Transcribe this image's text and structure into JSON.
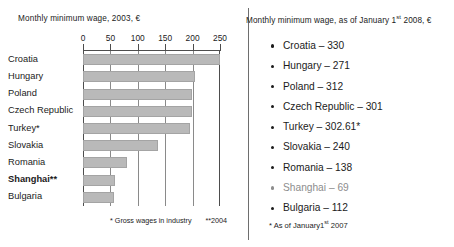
{
  "chart_data": {
    "type": "bar",
    "title": "Monthly minimum wage, 2003, €",
    "xlabel": "",
    "ylabel": "",
    "orientation": "horizontal",
    "xlim": [
      0,
      250
    ],
    "xticks": [
      0,
      50,
      100,
      150,
      200,
      250
    ],
    "xtick_labels": [
      "0",
      "50",
      "100",
      "150",
      "200",
      "250"
    ],
    "grid": true,
    "legend": "none",
    "categories": [
      "Croatia",
      "Hungary",
      "Poland",
      "Czech Republic",
      "Turkey*",
      "Slovakia",
      "Romania",
      "Shanghai**",
      "Bulgaria"
    ],
    "values": [
      250,
      205,
      199,
      199,
      195,
      137,
      80,
      58,
      57
    ],
    "bold_categories": [
      "Shanghai**"
    ],
    "footnote": "* Gross wages in industry   **2004",
    "footnote_parts": [
      "* Gross wages in industry",
      "**2004"
    ],
    "bar_color": "#b9b9b9"
  },
  "left": {
    "title": "Monthly minimum wage, 2003, €",
    "footnote_a": "* Gross wages in industry",
    "footnote_b": "**2004"
  },
  "right": {
    "title_prefix": "Monthly minimum wage, as of January 1",
    "title_sup": "st",
    "title_suffix": " 2008, €",
    "items": [
      {
        "label": "Croatia",
        "value": "330",
        "text": "Croatia – 330",
        "muted": false
      },
      {
        "label": "Hungary",
        "value": "271",
        "text": "Hungary – 271",
        "muted": false
      },
      {
        "label": "Poland",
        "value": "312",
        "text": "Poland – 312",
        "muted": false
      },
      {
        "label": "Czech Republic",
        "value": "301",
        "text": "Czech Republic – 301",
        "muted": false
      },
      {
        "label": "Turkey",
        "value": "302.61*",
        "text": "Turkey – 302.61*",
        "muted": false
      },
      {
        "label": "Slovakia",
        "value": "240",
        "text": "Slovakia – 240",
        "muted": false
      },
      {
        "label": "Romania",
        "value": "138",
        "text": "Romania – 138",
        "muted": false
      },
      {
        "label": "Shanghai",
        "value": "69",
        "text": "Shanghai – 69",
        "muted": true
      },
      {
        "label": "Bulgaria",
        "value": "112",
        "text": "Bulgaria – 112",
        "muted": false
      }
    ],
    "footnote_prefix": "* As of January1",
    "footnote_sup": "st",
    "footnote_suffix": " 2007"
  },
  "colors": {
    "bar_fill": "#b9b9b9",
    "bar_stroke": "#a4a4a4",
    "axis": "#4d4d4d",
    "gridline": "#8a8a8a",
    "text": "#1b1b1b",
    "muted_text": "#8d8d8d",
    "divider": "#6e6e6e",
    "background": "#ffffff"
  }
}
